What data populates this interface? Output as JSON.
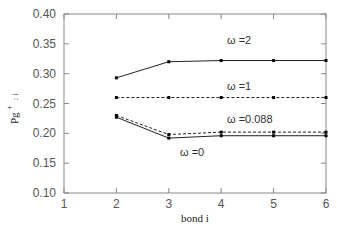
{
  "chart_data": {
    "type": "line",
    "title": "",
    "xlabel": "bond i",
    "ylabel": "Pg+ : i",
    "xlim": [
      1,
      6
    ],
    "ylim": [
      0.1,
      0.4
    ],
    "xticks": [
      "1",
      "2",
      "3",
      "4",
      "5",
      "6"
    ],
    "yticks": [
      "0.10",
      "0.15",
      "0.20",
      "0.25",
      "0.30",
      "0.35",
      "0.40"
    ],
    "grid": false,
    "legend": "inline labels",
    "x": [
      2,
      3,
      4,
      5,
      6
    ],
    "series": [
      {
        "name": "ω =2",
        "style": "solid",
        "values": [
          0.293,
          0.32,
          0.322,
          0.322,
          0.322
        ]
      },
      {
        "name": "ω =1",
        "style": "dashed",
        "values": [
          0.26,
          0.26,
          0.26,
          0.26,
          0.26
        ]
      },
      {
        "name": "ω =0.088",
        "style": "dashed",
        "values": [
          0.23,
          0.198,
          0.202,
          0.202,
          0.202
        ]
      },
      {
        "name": "ω =0",
        "style": "solid",
        "values": [
          0.227,
          0.192,
          0.196,
          0.196,
          0.196
        ]
      }
    ]
  },
  "labels": {
    "omega2": "ω =2",
    "omega1": "ω =1",
    "omega088": "ω =0.088",
    "omega0": "ω =0",
    "xlabel": "bond i",
    "ylabel_main": "Pg",
    "ylabel_sup": "+",
    "ylabel_sub": ": i"
  }
}
